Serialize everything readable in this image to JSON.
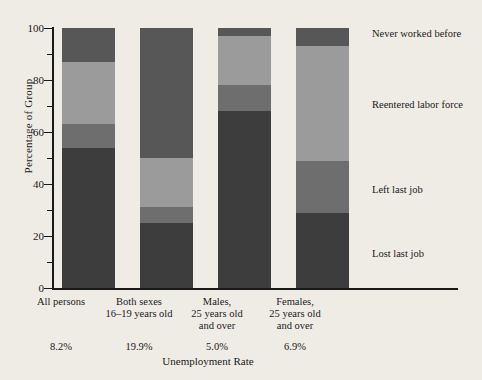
{
  "chart_data": {
    "type": "bar",
    "title": "",
    "subtitle": "",
    "stacked": true,
    "orientation": "vertical",
    "xlabel": "Unemployment Rate",
    "ylabel": "Percentage of Group",
    "ylim": [
      0,
      100
    ],
    "yticks": [
      0,
      20,
      40,
      60,
      80,
      100
    ],
    "ytick_labels": [
      "0",
      "20",
      "40",
      "60",
      "80",
      "100"
    ],
    "yminor_ticks": [
      10,
      30,
      50,
      70,
      90
    ],
    "grid": false,
    "legend_position": "right",
    "categories": [
      "All persons",
      "Both sexes\n16–19 years old",
      "Males,\n25 years old\nand over",
      "Females,\n25 years old\nand over"
    ],
    "category_lines": [
      [
        "All persons"
      ],
      [
        "Both sexes",
        "16–19 years old"
      ],
      [
        "Males,",
        "25 years old",
        "and over"
      ],
      [
        "Females,",
        "25 years old",
        "and over"
      ]
    ],
    "secondary_axis_label": "Unemployment Rate",
    "secondary_values": [
      "8.2%",
      "19.9%",
      "5.0%",
      "6.9%"
    ],
    "series": [
      {
        "name": "Lost last job",
        "color": "#3d3d3d",
        "values": [
          54,
          25,
          68,
          29
        ]
      },
      {
        "name": "Left last job",
        "color": "#6e6e6e",
        "values": [
          9,
          6,
          10,
          20
        ]
      },
      {
        "name": "Reentered labor force",
        "color": "#9b9b9b",
        "values": [
          24,
          19,
          19,
          44
        ]
      },
      {
        "name": "Never worked before",
        "color": "#575757",
        "values": [
          13,
          50,
          3,
          7
        ]
      }
    ]
  },
  "legend": {
    "items": [
      {
        "label": "Never worked before"
      },
      {
        "label": "Reentered labor force"
      },
      {
        "label": "Left last job"
      },
      {
        "label": "Lost last job"
      }
    ]
  },
  "axis": {
    "y_title": "Percentage of Group",
    "x_title": "Unemployment Rate",
    "y_tick_0": "0",
    "y_tick_20": "20",
    "y_tick_40": "40",
    "y_tick_60": "60",
    "y_tick_80": "80",
    "y_tick_100": "100"
  },
  "categories_display": [
    {
      "line1": "All persons",
      "line2": "",
      "line3": "",
      "rate": "8.2%"
    },
    {
      "line1": "Both sexes",
      "line2": "16–19 years old",
      "line3": "",
      "rate": "19.9%"
    },
    {
      "line1": "Males,",
      "line2": "25 years old",
      "line3": "and over",
      "rate": "5.0%"
    },
    {
      "line1": "Females,",
      "line2": "25 years old",
      "line3": "and over",
      "rate": "6.9%"
    }
  ]
}
